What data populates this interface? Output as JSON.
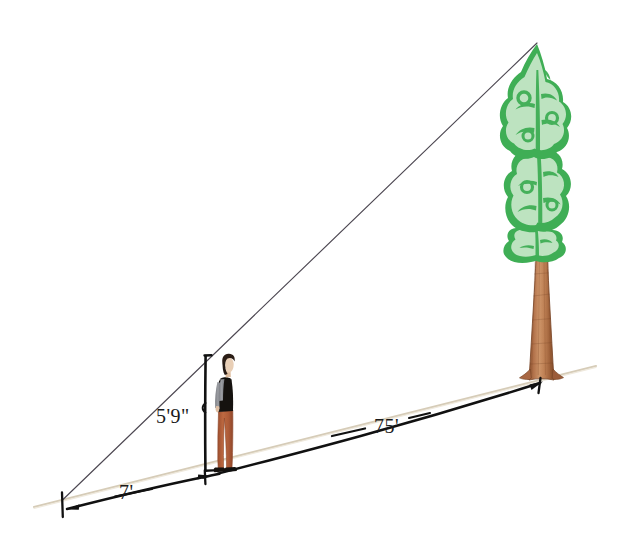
{
  "figure": {
    "background_color": "#ffffff",
    "width": 639,
    "height": 533
  },
  "labels": {
    "person_height": "5'9\"",
    "vertex_to_person": "7'",
    "person_to_tree": "75'"
  },
  "colors": {
    "ground_line": "#d8cfbd",
    "sight_line": "#4a4650",
    "dimension_line": "#111111",
    "text": "#1a1a1a",
    "foliage_light": "#b8e0bc",
    "foliage_dark": "#3aab52",
    "trunk_light": "#c98b5e",
    "trunk_mid": "#b5754a",
    "trunk_dark": "#8a5230",
    "person_hair": "#2a1c16",
    "person_face": "#e8cdb4",
    "person_vest": "#14110f",
    "person_shirt": "#8f9095",
    "person_pants": "#b5603b",
    "person_shoes": "#15110e"
  },
  "geometry": {
    "vertex": {
      "x": 62,
      "y": 500
    },
    "person_base": {
      "x": 226,
      "y": 472
    },
    "person_top": {
      "x": 226,
      "y": 356
    },
    "tree_base": {
      "x": 543,
      "y": 378
    },
    "tree_top": {
      "x": 537,
      "y": 42
    },
    "ground_left_end": {
      "x": 36,
      "y": 506
    },
    "ground_right_end": {
      "x": 592,
      "y": 367
    }
  },
  "elements": {
    "ground_line_name": "ground-line",
    "sight_line_name": "line-of-sight",
    "person_name": "observer-figure",
    "tree_name": "tree-figure"
  }
}
